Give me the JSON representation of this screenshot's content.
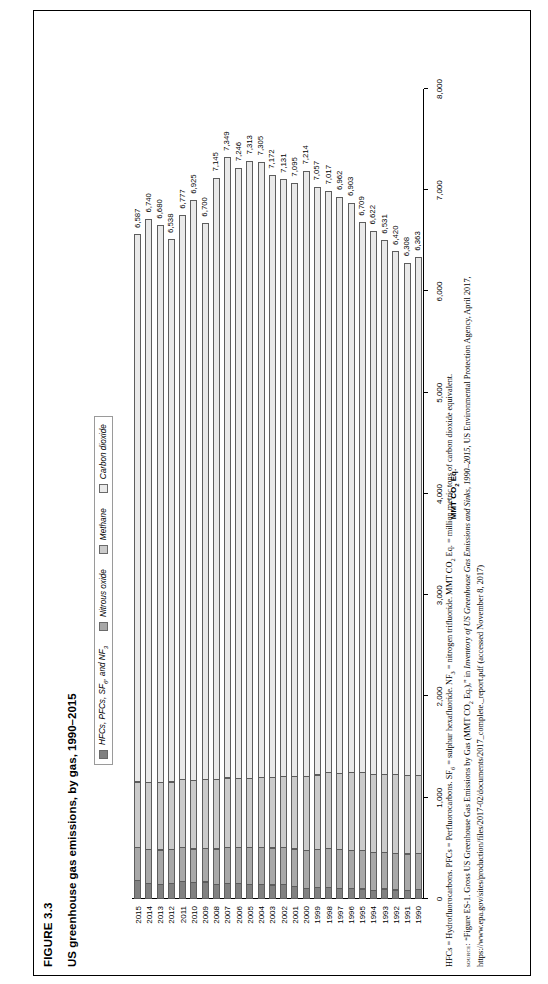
{
  "figure": {
    "number": "FIGURE 3.3",
    "title": "US greenhouse gas emissions, by gas, 1990–2015"
  },
  "legend": {
    "position": "top-center",
    "items": [
      {
        "label": "HFCs, PFCs, SF",
        "sub": "6",
        "tail": ", and NF",
        "sub2": "3",
        "color": "#818181",
        "name": "hfcs-pfcs-sf6-nf3"
      },
      {
        "label": "Nitrous oxide",
        "color": "#a8a8a8",
        "name": "nitrous-oxide"
      },
      {
        "label": "Methane",
        "color": "#cbcbcb",
        "name": "methane"
      },
      {
        "label": "Carbon dioxide",
        "color": "#e9e9e9",
        "name": "carbon-dioxide"
      }
    ]
  },
  "chart_data": {
    "type": "bar",
    "orientation": "horizontal-stacked",
    "title": "US greenhouse gas emissions, by gas, 1990–2015",
    "xlabel": "MMT CO2 Eq.",
    "ylabel": "",
    "xlim": [
      0,
      8000
    ],
    "xticks": [
      "0",
      "1,000",
      "2,000",
      "3,000",
      "4,000",
      "5,000",
      "6,000",
      "7,000",
      "8,000"
    ],
    "xtick_values": [
      0,
      1000,
      2000,
      3000,
      4000,
      5000,
      6000,
      7000,
      8000
    ],
    "grid": false,
    "legend_position": "top",
    "categories": [
      "1990",
      "1991",
      "1992",
      "1993",
      "1994",
      "1995",
      "1996",
      "1997",
      "1998",
      "1999",
      "2000",
      "2001",
      "2002",
      "2003",
      "2004",
      "2005",
      "2006",
      "2007",
      "2008",
      "2009",
      "2010",
      "2011",
      "2012",
      "2013",
      "2014",
      "2015"
    ],
    "totals": [
      6363,
      6308,
      6420,
      6531,
      6622,
      6709,
      6903,
      6962,
      7017,
      7057,
      7214,
      7095,
      7131,
      7172,
      7305,
      7313,
      7246,
      7349,
      7145,
      6700,
      6925,
      6777,
      6538,
      6680,
      6740,
      6587
    ],
    "total_labels": [
      "6,363",
      "6,308",
      "6,420",
      "6,531",
      "6,622",
      "6,709",
      "6,903",
      "6,962",
      "7,017",
      "7,057",
      "7,214",
      "7,095",
      "7,131",
      "7,172",
      "7,305",
      "7,313",
      "7,246",
      "7,349",
      "7,145",
      "6,700",
      "6,925",
      "6,777",
      "6,538",
      "6,680",
      "6,740",
      "6,587"
    ],
    "series": [
      {
        "name": "Carbon dioxide",
        "color": "#e9e9e9",
        "values": [
          5122,
          5071,
          5172,
          5280,
          5369,
          5441,
          5637,
          5702,
          5750,
          5812,
          5985,
          5866,
          5899,
          5955,
          6086,
          6105,
          6033,
          6135,
          5944,
          5502,
          5735,
          5573,
          5363,
          5509,
          5566,
          5411
        ]
      },
      {
        "name": "Methane",
        "color": "#cbcbcb",
        "values": [
          780,
          781,
          784,
          776,
          781,
          779,
          773,
          763,
          753,
          744,
          736,
          723,
          713,
          702,
          695,
          690,
          689,
          694,
          696,
          686,
          684,
          685,
          677,
          676,
          675,
          656
        ]
      },
      {
        "name": "Nitrous oxide",
        "color": "#a8a8a8",
        "values": [
          360,
          365,
          372,
          373,
          388,
          387,
          385,
          392,
          394,
          380,
          382,
          375,
          372,
          372,
          373,
          370,
          364,
          360,
          356,
          341,
          343,
          340,
          338,
          350,
          341,
          334
        ]
      },
      {
        "name": "HFCs, PFCs, SF6, and NF3",
        "color": "#818181",
        "values": [
          101,
          91,
          92,
          102,
          84,
          102,
          108,
          105,
          120,
          121,
          111,
          131,
          147,
          143,
          151,
          148,
          160,
          160,
          149,
          171,
          163,
          179,
          160,
          145,
          158,
          186
        ]
      }
    ]
  },
  "notes": {
    "abbreviations": "HFCs = Hydrofluorocarbons. PFCs = Perfluorocarbons. SF6 = sulphur hexafluoride. NF3 = nitrogen trifluoride. MMT CO2 Eq. = million metric tons of carbon dioxide equivalent.",
    "source_keyword": "source:",
    "source_text_1": "“Figure ES-1. Gross US Greenhouse Gas Emissions by Gas (MMT CO2 Eq.),” in ",
    "source_italic": "Inventory of US Greenhouse Gas Emissions and Sinks, 1990–2015",
    "source_text_2": ", US Environmental Protection Agency, April 2017,",
    "source_url": "https://www.epa.gov/sites/production/files/2017-02/documents/2017_complete._report.pdf (accessed November 8, 2017)"
  }
}
